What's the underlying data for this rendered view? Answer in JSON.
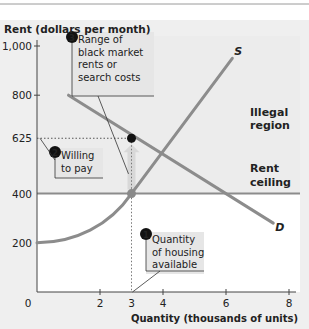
{
  "chart_data": {
    "type": "line",
    "title": "",
    "xlabel": "Quantity (thousands of units)",
    "ylabel": "Rent (dollars per month)",
    "xlim": [
      0,
      8
    ],
    "ylim": [
      0,
      1000
    ],
    "xticks": [
      {
        "value": 0,
        "label": "0"
      },
      {
        "value": 2,
        "label": "2"
      },
      {
        "value": 3,
        "label": "3"
      },
      {
        "value": 4,
        "label": "4"
      },
      {
        "value": 6,
        "label": "6"
      },
      {
        "value": 8,
        "label": "8"
      }
    ],
    "yticks": [
      {
        "value": 200,
        "label": "200"
      },
      {
        "value": 400,
        "label": "400"
      },
      {
        "value": 625,
        "label": "625"
      },
      {
        "value": 800,
        "label": "800"
      },
      {
        "value": 1000,
        "label": "1,000"
      }
    ],
    "series": [
      {
        "name": "S",
        "label": "S",
        "points": [
          [
            0,
            200
          ],
          [
            1,
            225
          ],
          [
            2,
            290
          ],
          [
            3,
            400
          ],
          [
            6.2,
            950
          ]
        ]
      },
      {
        "name": "D",
        "label": "D",
        "points": [
          [
            1,
            800
          ],
          [
            3,
            625
          ],
          [
            5.6,
            400
          ],
          [
            7.5,
            280
          ]
        ]
      }
    ],
    "rent_ceiling": {
      "value": 400,
      "label_line1": "Rent",
      "label_line2": "ceiling"
    },
    "illegal_region": {
      "label_line1": "Illegal",
      "label_line2": "region"
    },
    "points": [
      {
        "name": "black-market-price",
        "x": 3,
        "y": 625,
        "color": "#111111"
      },
      {
        "name": "ceiling-supply",
        "x": 3,
        "y": 400,
        "color": "#8a8a8a"
      }
    ],
    "annotations": [
      {
        "number": "1",
        "lines": [
          "Quantity",
          "of housing",
          "available"
        ]
      },
      {
        "number": "2",
        "lines": [
          "Willing",
          "to pay"
        ]
      },
      {
        "number": "3",
        "lines": [
          "Range of",
          "black market",
          "rents or",
          "search costs"
        ]
      }
    ],
    "grid": false,
    "colors": {
      "curve": "#8c8c8c",
      "axis": "#444444",
      "illegal_bg": "#ececec",
      "callout_bg": "#e6e6e6"
    }
  }
}
